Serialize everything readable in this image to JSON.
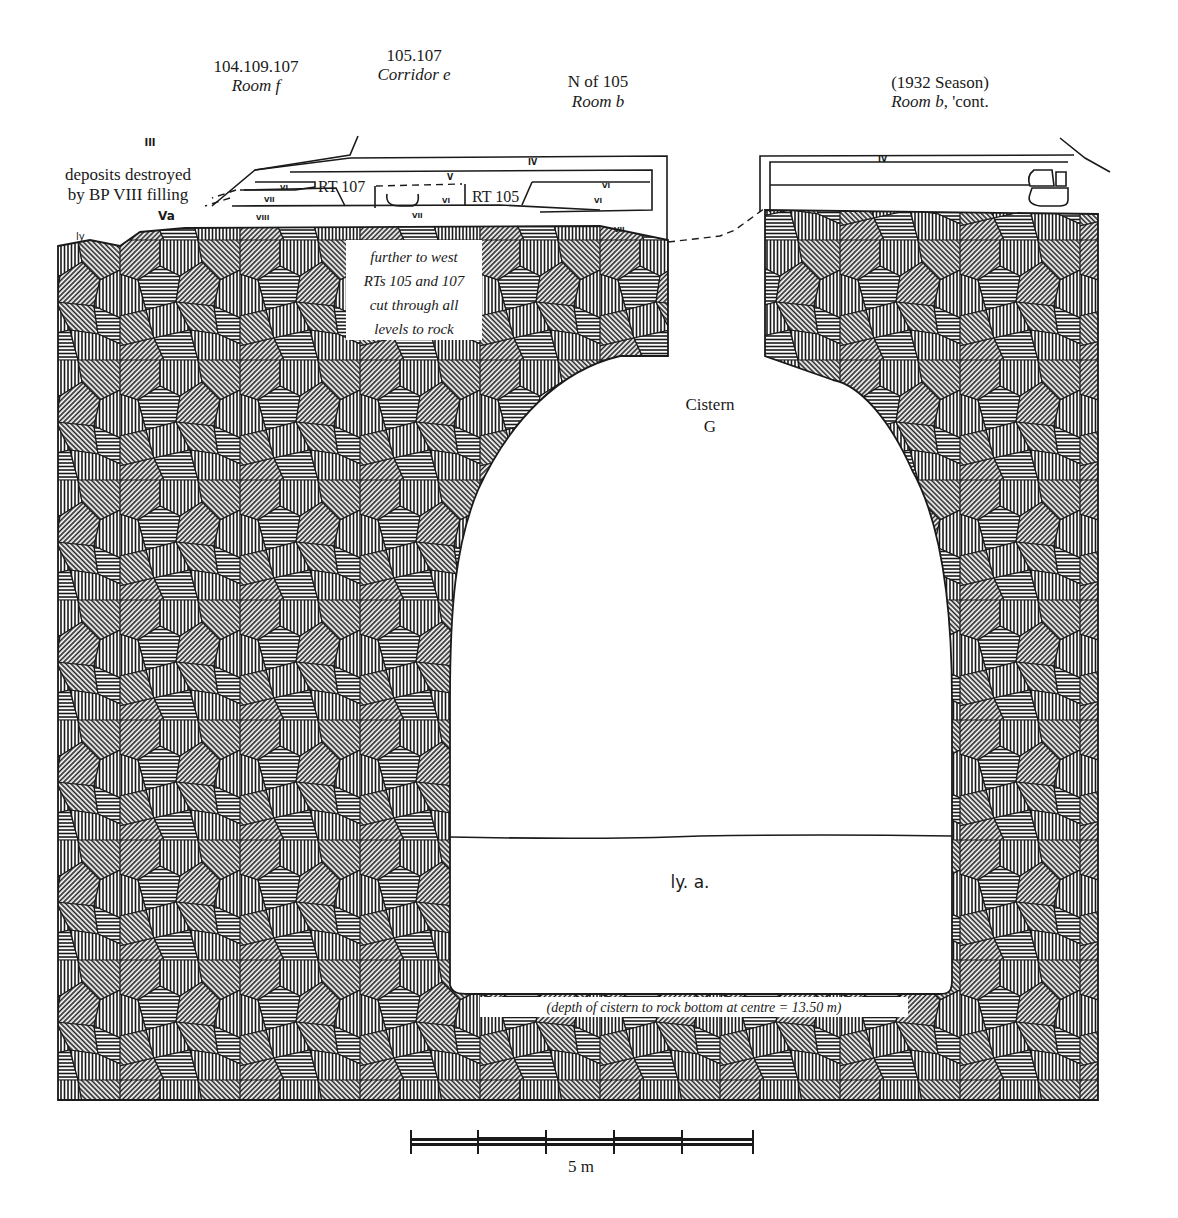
{
  "section_labels": [
    {
      "code": "104.109.107",
      "room": "Room f"
    },
    {
      "code": "105.107",
      "room": "Corridor e"
    },
    {
      "code": "N of 105",
      "room": "Room b"
    },
    {
      "code": "(1932 Season)",
      "room": "Room b",
      "room_suffix": ", 'cont."
    }
  ],
  "annotations": {
    "deposits_line1": "deposits destroyed",
    "deposits_line2": "by BP VIII filling",
    "west_note": [
      "further to west",
      "RTs 105 and 107",
      "cut through all",
      "levels to rock"
    ],
    "cistern_name": "Cistern",
    "cistern_letter": "G",
    "cistern_fill_label": "ly. a.",
    "depth_note": "(depth of cistern to rock bottom at centre = 13.50 m)"
  },
  "level_marks": {
    "iii": "III",
    "iv_left": "IV",
    "iv_right": "IV",
    "v": "V",
    "va": "Va",
    "vi_a": "VI",
    "vi_b": "VI",
    "vi_c": "VI",
    "vi_d": "VI",
    "vii_a": "VII",
    "vii_b": "VII",
    "vii_c": "VII",
    "viii": "VIII",
    "ly_left": "ly"
  },
  "trenches": {
    "rt107": "RT 107",
    "rt105": "RT 105"
  },
  "scale_bar": {
    "label": "5 m",
    "segments": 5,
    "total_m": 5
  }
}
